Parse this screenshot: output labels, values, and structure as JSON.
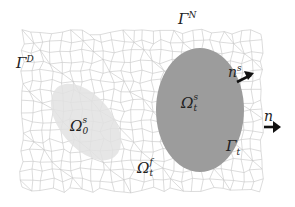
{
  "diagram": {
    "type": "fluid-structure-domain",
    "colors": {
      "mesh_line": "#bdbdbd",
      "background": "#ffffff",
      "solid_current": "#9a9a9a",
      "solid_initial": "#e6e6e6",
      "text": "#222222",
      "arrow": "#111111"
    },
    "labels": {
      "dirichlet_boundary": {
        "base": "Γ",
        "sup": "D"
      },
      "neumann_boundary": {
        "base": "Γ",
        "sup": "N"
      },
      "solid_normal": {
        "base": "n",
        "sup": "s"
      },
      "outer_normal": {
        "base": "n"
      },
      "solid_initial_domain": {
        "base": "Ω",
        "sup": "s",
        "sub": "0"
      },
      "solid_current_domain": {
        "base": "Ω",
        "sup": "s",
        "sub": "t"
      },
      "fluid_domain": {
        "base": "Ω",
        "sup": "f",
        "sub": "t"
      },
      "interface_boundary": {
        "base": "Γ",
        "sub": "t"
      }
    }
  }
}
